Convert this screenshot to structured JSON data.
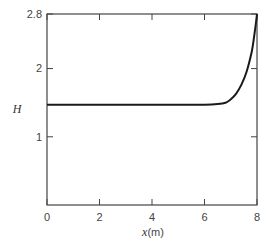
{
  "chart_data": {
    "type": "line",
    "title": "",
    "xlabel": "x(m)",
    "xlabel_var": "x",
    "xlabel_unit": "(m)",
    "ylabel": "H",
    "xlim": [
      0,
      8
    ],
    "ylim": [
      0,
      2.8
    ],
    "grid": false,
    "legend": null,
    "x_ticks": [
      "0",
      "2",
      "4",
      "6",
      "8"
    ],
    "y_ticks": [
      "1",
      "2",
      "2.8"
    ],
    "series": [
      {
        "name": "H(x)",
        "color": "#1a1a1a",
        "x": [
          0,
          1,
          2,
          3,
          4,
          5,
          6,
          6.5,
          6.8,
          7.0,
          7.2,
          7.4,
          7.6,
          7.8,
          7.9,
          8.0
        ],
        "values": [
          1.47,
          1.47,
          1.47,
          1.47,
          1.47,
          1.47,
          1.47,
          1.48,
          1.5,
          1.55,
          1.63,
          1.76,
          1.95,
          2.25,
          2.5,
          2.8
        ]
      }
    ]
  }
}
